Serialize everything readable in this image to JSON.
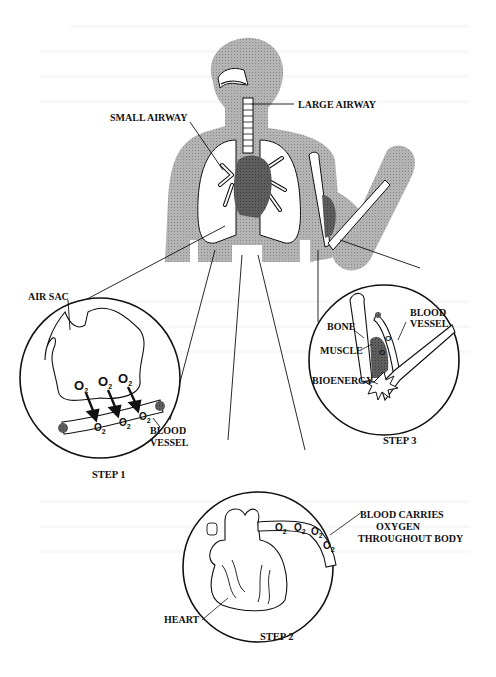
{
  "figure": {
    "top_labels": {
      "large_airway": "LARGE AIRWAY",
      "small_airway": "SMALL AIRWAY"
    },
    "step1": {
      "title": "STEP 1",
      "air_sac": "AIR SAC",
      "blood_vessel_line1": "BLOOD",
      "blood_vessel_line2": "VESSEL",
      "oxygen": "O",
      "oxygen_sub": "2"
    },
    "step2": {
      "title": "STEP 2",
      "heart": "HEART",
      "caption_line1": "BLOOD CARRIES",
      "caption_line2": "OXYGEN",
      "caption_line3": "THROUGHOUT BODY",
      "oxygen": "O",
      "oxygen_sub": "2"
    },
    "step3": {
      "title": "STEP 3",
      "bone": "BONE",
      "muscle": "MUSCLE",
      "bioenergy": "BIOENERGY",
      "blood_vessel_line1": "BLOOD",
      "blood_vessel_line2": "VESSEL",
      "oxygen": "O",
      "oxygen_sub": "2"
    },
    "colors": {
      "silhouette": "#a6a6a6",
      "organ_dark": "#5a5a5a",
      "ink": "#111111"
    }
  }
}
